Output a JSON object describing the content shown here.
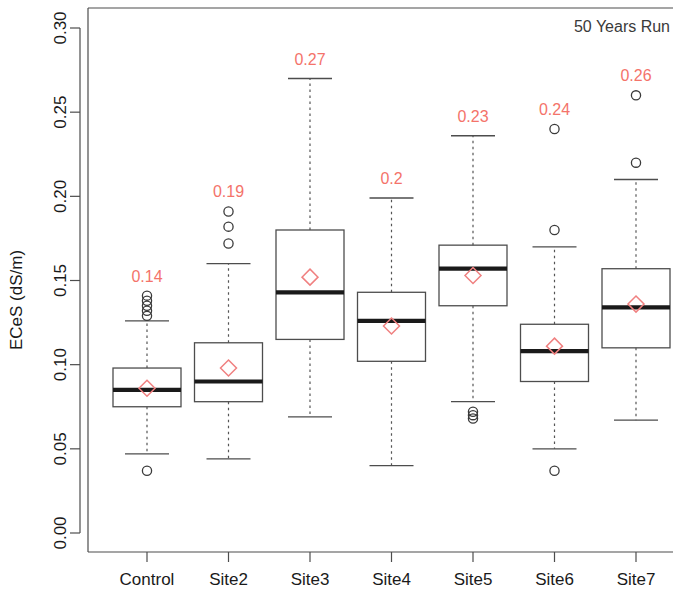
{
  "chart_data": {
    "type": "boxplot",
    "title": "",
    "annotation": "50 Years Run",
    "xlabel": "",
    "ylabel": "ECeS (dS/m)",
    "ylim": [
      0.0,
      0.315
    ],
    "yticks": [
      0.0,
      0.05,
      0.1,
      0.15,
      0.2,
      0.25,
      0.3
    ],
    "ytick_labels": [
      "0.00",
      "0.05",
      "0.10",
      "0.15",
      "0.20",
      "0.25",
      "0.30"
    ],
    "grid": false,
    "legend": "none",
    "categories": [
      "Control",
      "Site2",
      "Site3",
      "Site4",
      "Site5",
      "Site6",
      "Site7"
    ],
    "max_labels": [
      "0.14",
      "0.19",
      "0.27",
      "0.2",
      "0.23",
      "0.24",
      "0.26"
    ],
    "boxes": [
      {
        "name": "Control",
        "whisker_low": 0.047,
        "q1": 0.075,
        "median": 0.085,
        "q3": 0.098,
        "whisker_high": 0.126,
        "mean": 0.086,
        "outliers": [
          0.037,
          0.129,
          0.132,
          0.135,
          0.138,
          0.141
        ],
        "max_label": "0.14"
      },
      {
        "name": "Site2",
        "whisker_low": 0.044,
        "q1": 0.078,
        "median": 0.09,
        "q3": 0.113,
        "whisker_high": 0.16,
        "mean": 0.098,
        "outliers": [
          0.172,
          0.182,
          0.191
        ],
        "max_label": "0.19"
      },
      {
        "name": "Site3",
        "whisker_low": 0.069,
        "q1": 0.115,
        "median": 0.143,
        "q3": 0.18,
        "whisker_high": 0.27,
        "mean": 0.152,
        "outliers": [],
        "max_label": "0.27"
      },
      {
        "name": "Site4",
        "whisker_low": 0.04,
        "q1": 0.102,
        "median": 0.126,
        "q3": 0.143,
        "whisker_high": 0.199,
        "mean": 0.123,
        "outliers": [],
        "max_label": "0.2"
      },
      {
        "name": "Site5",
        "whisker_low": 0.078,
        "q1": 0.135,
        "median": 0.157,
        "q3": 0.171,
        "whisker_high": 0.236,
        "mean": 0.153,
        "outliers": [
          0.068,
          0.07,
          0.072
        ],
        "max_label": "0.23"
      },
      {
        "name": "Site6",
        "whisker_low": 0.05,
        "q1": 0.09,
        "median": 0.108,
        "q3": 0.124,
        "whisker_high": 0.17,
        "mean": 0.111,
        "outliers": [
          0.037,
          0.18,
          0.24
        ],
        "max_label": "0.24"
      },
      {
        "name": "Site7",
        "whisker_low": 0.067,
        "q1": 0.11,
        "median": 0.134,
        "q3": 0.157,
        "whisker_high": 0.21,
        "mean": 0.136,
        "outliers": [
          0.22,
          0.26
        ],
        "max_label": "0.26"
      }
    ],
    "colors": {
      "mean_marker": "#f08080",
      "value_label": "#f4736a",
      "box_stroke": "#4d4d4d",
      "median": "#1a1a1a",
      "outlier": "#3a3a3a",
      "background": "#ffffff"
    }
  }
}
